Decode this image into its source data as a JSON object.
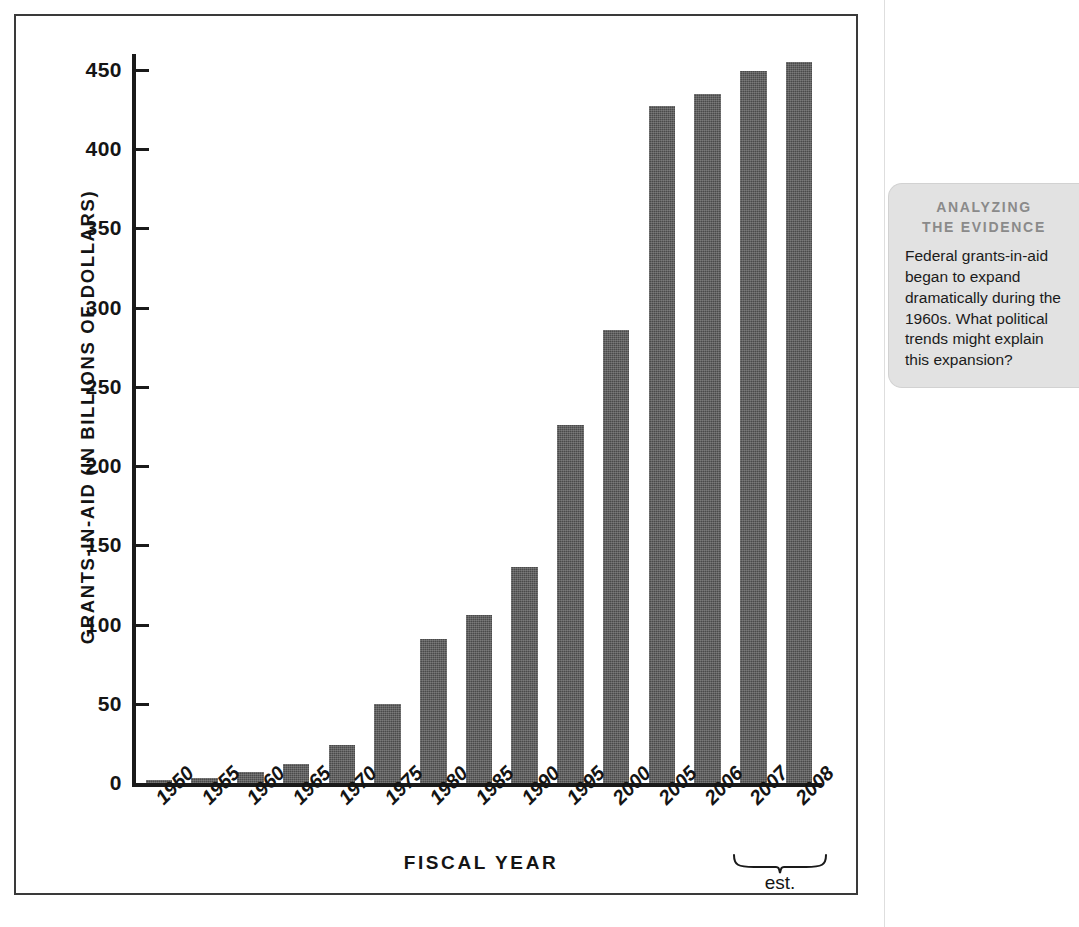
{
  "chart_data": {
    "type": "bar",
    "title": "",
    "xlabel": "FISCAL YEAR",
    "ylabel": "GRANTS-IN-AID (IN BILLIONS OF DOLLARS)",
    "categories": [
      "1950",
      "1955",
      "1960",
      "1965",
      "1970",
      "1975",
      "1980",
      "1985",
      "1990",
      "1995",
      "2000",
      "2005",
      "2006",
      "2007",
      "2008"
    ],
    "values": [
      2,
      3,
      7,
      12,
      24,
      50,
      91,
      106,
      136,
      226,
      286,
      427,
      435,
      449,
      455
    ],
    "ylim": [
      0,
      460
    ],
    "yticks": [
      0,
      50,
      100,
      150,
      200,
      250,
      300,
      350,
      400,
      450
    ],
    "ytick_labels": [
      "0",
      "50",
      "100",
      "150",
      "200",
      "250",
      "300",
      "350",
      "400",
      "450"
    ],
    "grid": false,
    "legend": null,
    "bar_color": "#4a4a4a",
    "axis_color": "#1a1a1a",
    "annotations": [
      {
        "name": "estimate-brace",
        "label": "est.",
        "covers": [
          "2007",
          "2008"
        ]
      }
    ]
  },
  "axis": {
    "y_title": "GRANTS-IN-AID (IN BILLIONS OF DOLLARS)",
    "x_title": "FISCAL YEAR"
  },
  "estimate_note": {
    "label": "est."
  },
  "evidence_callout": {
    "header_line1": "ANALYZING",
    "header_line2": "THE EVIDENCE",
    "body": "Federal grants-in-aid began to expand dramatically during the 1960s. What political trends might explain this expansion?",
    "background_color": "#e2e2e2",
    "header_color": "#8a8a8a"
  }
}
